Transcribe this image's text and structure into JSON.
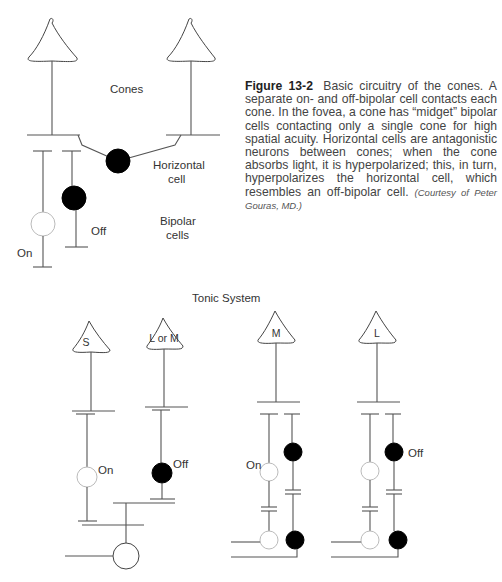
{
  "figure": {
    "number": "Figure 13-2",
    "caption": "Basic circuitry of the cones. A separate on- and off-bipolar cell contacts each cone. In the fovea, a cone has “midget” bipolar cells contacting only a single cone for high spatial acuity. Horizontal cells are antagonistic neurons between cones; when the cone absorbs light, it is hyperpolarized; this, in turn, hyperpolarizes the horizontal cell, which resembles an off-bipolar cell.",
    "credit": "(Courtesy of Peter Gouras, MD.)"
  },
  "top_diagram": {
    "labels": {
      "cones": "Cones",
      "horizontal_1": "Horizontal",
      "horizontal_2": "cell",
      "bipolar_1": "Bipolar",
      "bipolar_2": "cells",
      "on": "On",
      "off": "Off"
    }
  },
  "bottom_diagram": {
    "title": "Tonic System",
    "cones": [
      {
        "label": "S"
      },
      {
        "label": "L or M"
      },
      {
        "label": "M"
      },
      {
        "label": "L"
      }
    ],
    "labels": {
      "s_on": "On",
      "lm_off": "Off",
      "m_on": "On",
      "l_off": "Off"
    }
  }
}
